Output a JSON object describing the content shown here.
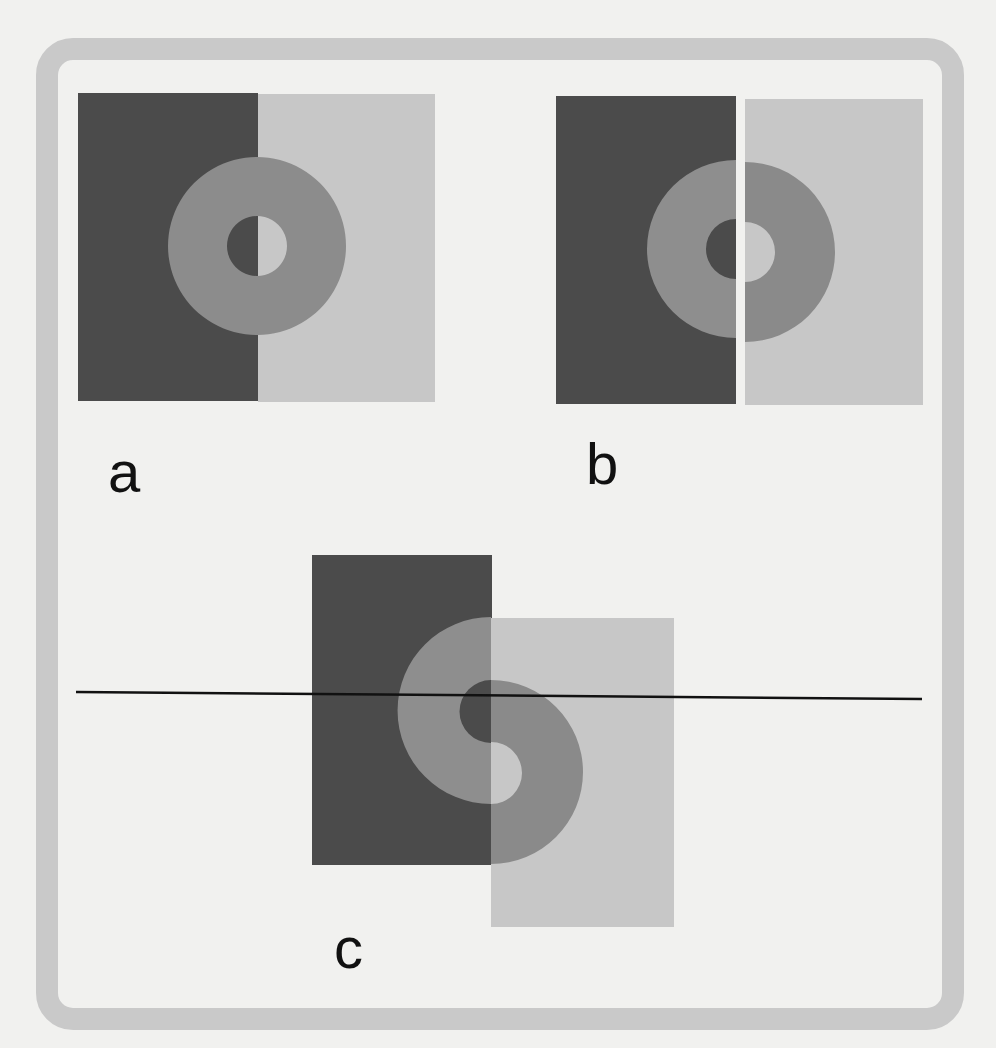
{
  "figure": {
    "colors": {
      "background": "#f1f1ef",
      "frame": "#c9c9c9",
      "dark_field": "#4b4b4b",
      "light_field": "#c7c7c7",
      "ring": "#8c8c8c",
      "ring_on_dark_appearance": "#8e8e8e",
      "ring_on_light_appearance": "#8a8a8a",
      "line": "#111111"
    },
    "panels": [
      {
        "id": "a",
        "label": "a",
        "caption": "Uniform gray ring straddling a dark/light boundary"
      },
      {
        "id": "b",
        "label": "b",
        "caption": "Ring halves separated by a thin white gap"
      },
      {
        "id": "c",
        "label": "c",
        "caption": "Ring halves vertically offset along the boundary, with a horizontal reference line"
      }
    ]
  }
}
